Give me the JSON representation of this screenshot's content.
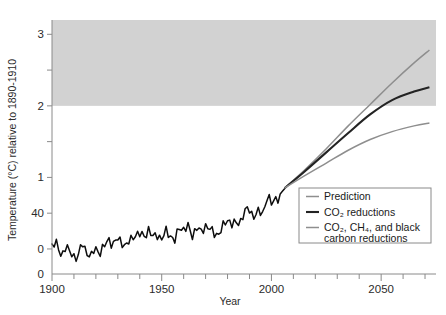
{
  "chart_data": {
    "type": "line",
    "title": "",
    "xlabel": "Year",
    "ylabel": "Temperature (°C) relative to 1890-1910",
    "xlim": [
      1900,
      2075
    ],
    "ylim": [
      -0.35,
      3.2
    ],
    "grid": false,
    "x_ticks_major": [
      1900,
      1950,
      2000,
      2050
    ],
    "x_tick_labels": [
      "1900",
      "1950",
      "2000",
      "2050"
    ],
    "x_tick_minor_step": 10,
    "y_ticks": [
      0,
      0.5,
      1,
      1.5,
      2,
      2.5,
      3
    ],
    "y_tick_labels": [
      "0",
      "40",
      "1",
      "",
      "2",
      "",
      "3"
    ],
    "y_origin_label": "0",
    "shaded_band": {
      "label": "",
      "y_from": 2,
      "y_to": 3.2,
      "color": "#d2d2d2"
    },
    "legend": {
      "position": "bottom-right",
      "entries": [
        {
          "label": "Prediction",
          "color": "#8e8e8e",
          "width": 1.5
        },
        {
          "label": "CO₂ reductions",
          "color": "#232323",
          "width": 2.1
        },
        {
          "label": "CO₂, CH₄, and black",
          "label2": "carbon reductions",
          "color": "#8e8e8e",
          "width": 1.5
        }
      ]
    },
    "series": [
      {
        "name": "Observed temperature anomaly",
        "kind": "historical",
        "color": "#0d0d0d",
        "x": [
          1900,
          1902,
          1904,
          1906,
          1908,
          1910,
          1912,
          1914,
          1916,
          1918,
          1920,
          1922,
          1924,
          1926,
          1928,
          1930,
          1932,
          1934,
          1936,
          1938,
          1940,
          1942,
          1944,
          1946,
          1948,
          1950,
          1952,
          1954,
          1956,
          1958,
          1960,
          1962,
          1964,
          1966,
          1968,
          1970,
          1972,
          1974,
          1976,
          1978,
          1980,
          1982,
          1984,
          1986,
          1988,
          1990,
          1992,
          1994,
          1996,
          1998,
          2000,
          2002,
          2004,
          2006
        ],
        "values": [
          0.1,
          0.02,
          -0.06,
          0.04,
          -0.08,
          -0.07,
          -0.1,
          0.05,
          -0.02,
          -0.12,
          0.0,
          -0.02,
          0.02,
          0.14,
          0.08,
          0.12,
          0.1,
          0.05,
          0.12,
          0.22,
          0.2,
          0.17,
          0.28,
          0.16,
          0.2,
          0.14,
          0.25,
          0.18,
          0.12,
          0.3,
          0.27,
          0.32,
          0.18,
          0.3,
          0.24,
          0.32,
          0.28,
          0.22,
          0.2,
          0.32,
          0.42,
          0.34,
          0.36,
          0.4,
          0.52,
          0.56,
          0.46,
          0.5,
          0.52,
          0.72,
          0.62,
          0.74,
          0.7,
          0.84
        ]
      },
      {
        "name": "Prediction",
        "kind": "projection",
        "color": "#8e8e8e",
        "x": [
          2006,
          2015,
          2025,
          2035,
          2045,
          2055,
          2065,
          2072
        ],
        "values": [
          0.85,
          1.1,
          1.4,
          1.72,
          2.02,
          2.32,
          2.6,
          2.78
        ]
      },
      {
        "name": "CO2 reductions",
        "kind": "projection",
        "color": "#232323",
        "x": [
          2006,
          2015,
          2025,
          2035,
          2045,
          2055,
          2065,
          2072
        ],
        "values": [
          0.85,
          1.08,
          1.35,
          1.62,
          1.88,
          2.08,
          2.2,
          2.26
        ]
      },
      {
        "name": "CO2, CH4, and black carbon reductions",
        "kind": "projection",
        "color": "#8e8e8e",
        "x": [
          2006,
          2015,
          2025,
          2035,
          2045,
          2055,
          2065,
          2072
        ],
        "values": [
          0.85,
          1.02,
          1.2,
          1.38,
          1.53,
          1.64,
          1.72,
          1.76
        ]
      }
    ]
  }
}
